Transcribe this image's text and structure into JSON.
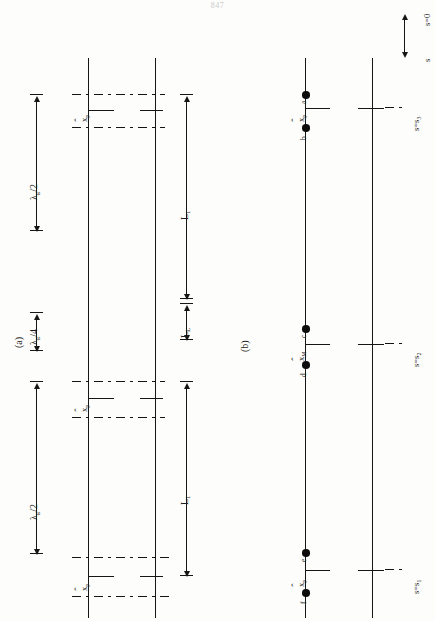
{
  "page": {
    "number": "847"
  },
  "figure": {
    "panels": [
      {
        "id": "a",
        "label": "(a)"
      },
      {
        "id": "b",
        "label": "(b)"
      }
    ]
  },
  "panel_a": {
    "dimension_labels": [
      {
        "name": "lambda-g-over-2-top",
        "text": "λ",
        "sub": "g",
        "suffix": "/2"
      },
      {
        "name": "lambda-g-over-4",
        "text": "λ",
        "sub": "g",
        "suffix": "/4"
      },
      {
        "name": "lambda-g-over-2-bottom",
        "text": "λ",
        "sub": "g",
        "suffix": "/2"
      }
    ],
    "length_labels": [
      {
        "name": "L-1-upper",
        "text": "L",
        "sub": "1"
      },
      {
        "name": "L-L",
        "text": "L",
        "sub": "L"
      },
      {
        "name": "L-1-lower",
        "text": "L",
        "sub": "1"
      }
    ],
    "iris_labels": [
      {
        "name": "x-hat-p-iris-1",
        "text": "x",
        "sub": "p",
        "hat": true
      },
      {
        "name": "x-hat-p-iris-2",
        "text": "x",
        "sub": "p",
        "hat": true
      },
      {
        "name": "x-hat-p-iris-3",
        "text": "x",
        "sub": "p",
        "hat": true
      }
    ]
  },
  "panel_b": {
    "axis_label": {
      "name": "s-axis",
      "text": "s"
    },
    "origin_label": {
      "name": "s-equals-0",
      "text": "s=0"
    },
    "station_labels": [
      {
        "name": "s-equals-s3",
        "text": "s=s",
        "sub": "3"
      },
      {
        "name": "s-equals-s2",
        "text": "s=s",
        "sub": "2"
      },
      {
        "name": "s-equals-s1",
        "text": "s=s",
        "sub": "1"
      }
    ],
    "offset_labels": [
      {
        "name": "x-hat-p-upper",
        "text": "x",
        "sub": "p",
        "hat": true
      },
      {
        "name": "x-hat-M",
        "text": "x",
        "sub": "M",
        "hat": true
      },
      {
        "name": "x-hat-p-lower",
        "text": "x",
        "sub": "p",
        "hat": true
      }
    ],
    "points": [
      {
        "name": "point-a",
        "label": "a"
      },
      {
        "name": "point-b",
        "label": "b"
      },
      {
        "name": "point-c",
        "label": "c"
      },
      {
        "name": "point-d",
        "label": "d"
      },
      {
        "name": "point-e",
        "label": "e"
      },
      {
        "name": "point-f",
        "label": "f"
      }
    ]
  },
  "style": {
    "ink": "#161616",
    "paper": "#fdfdfc"
  }
}
